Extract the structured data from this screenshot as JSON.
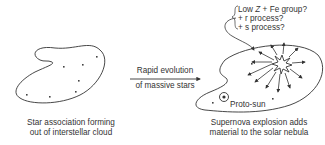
{
  "left_panel": {
    "caption_line1": "Star association forming",
    "caption_line2": "out of interstellar cloud"
  },
  "transition": {
    "label_line1": "Rapid evolution",
    "label_line2": "of massive stars"
  },
  "right_panel": {
    "caption_line1": "Supernova explosion adds",
    "caption_line2": "material to the solar nebula",
    "proto_sun_label": "Proto-sun",
    "notes": {
      "line1_prefix": "Low ",
      "line1_italic": "Z",
      "line1_suffix": " + Fe group?",
      "line2": "+ r process?",
      "line3": "+ s process?"
    }
  },
  "colors": {
    "stroke": "#333333",
    "text": "#333333",
    "background": "#ffffff"
  }
}
